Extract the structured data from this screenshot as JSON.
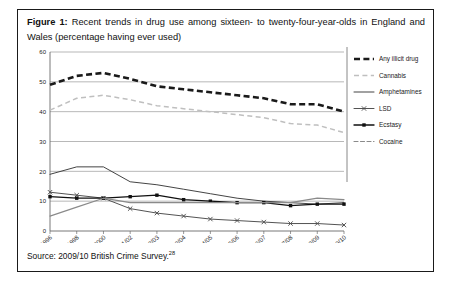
{
  "caption": {
    "figure_label": "Figure 1:",
    "text": " Recent trends in drug use among sixteen- to twenty-four-year-olds in England and Wales (percentage having ever used)"
  },
  "source": {
    "text": "Source: 2009/10 British Crime Survey.",
    "footnote_marker": "28"
  },
  "colors": {
    "any_illicit_drug": "#1a1a1a",
    "cannabis": "#bfbfbf",
    "amphetamines": "#3a3a3a",
    "lsd": "#4a4a4a",
    "ecstasy": "#111111",
    "cocaine": "#8a8a8a",
    "grid": "#9a9a9a",
    "axis": "#6a6a6a",
    "border": "#1a1a1a"
  },
  "chart_data": {
    "type": "line",
    "title": "Recent trends in drug use among sixteen- to twenty-four-year-olds in England and Wales (percentage having ever used)",
    "xlabel": "",
    "ylabel": "",
    "ylim": [
      0,
      60
    ],
    "yticks": [
      0,
      10,
      20,
      30,
      40,
      50,
      60
    ],
    "ytick_labels": [
      "0",
      "10",
      "20",
      "30",
      "40",
      "50",
      "60"
    ],
    "grid": true,
    "legend_position": "right",
    "categories": [
      "1996",
      "1998",
      "2000",
      "2001/02",
      "2002/03",
      "2003/04",
      "2004/05",
      "2005/06",
      "2006/07",
      "2007/08",
      "2008/09",
      "2009/10"
    ],
    "series": [
      {
        "name": "Any illicit drug",
        "style": "thick-dashed",
        "color": "#1a1a1a",
        "values": [
          49.0,
          52.0,
          53.0,
          51.0,
          48.5,
          47.5,
          46.5,
          45.5,
          44.5,
          42.5,
          42.5,
          40.0
        ]
      },
      {
        "name": "Cannabis",
        "style": "light-dashed",
        "color": "#bfbfbf",
        "values": [
          40.5,
          44.5,
          45.5,
          44.0,
          42.0,
          41.0,
          40.0,
          39.0,
          38.0,
          36.0,
          35.5,
          33.0
        ]
      },
      {
        "name": "Amphetamines",
        "style": "solid",
        "color": "#3a3a3a",
        "values": [
          19.0,
          21.5,
          21.5,
          16.5,
          15.5,
          14.0,
          12.5,
          11.0,
          10.0,
          9.5,
          9.0,
          9.5
        ]
      },
      {
        "name": "LSD",
        "style": "solid-cross",
        "color": "#4a4a4a",
        "values": [
          13.0,
          12.0,
          11.0,
          7.5,
          6.0,
          5.0,
          4.0,
          3.5,
          3.0,
          2.5,
          2.5,
          2.0
        ]
      },
      {
        "name": "Ecstasy",
        "style": "solid-square",
        "color": "#111111",
        "values": [
          11.5,
          11.0,
          11.0,
          11.5,
          12.0,
          10.5,
          10.0,
          9.5,
          9.5,
          8.5,
          9.0,
          9.0
        ]
      },
      {
        "name": "Cocaine",
        "style": "dash-dot",
        "color": "#8a8a8a",
        "values": [
          5.0,
          8.0,
          11.0,
          9.5,
          9.5,
          9.5,
          9.5,
          9.5,
          9.5,
          9.5,
          11.0,
          10.5
        ]
      }
    ]
  },
  "legend": {
    "items": [
      {
        "label": "Any illicit drug"
      },
      {
        "label": "Cannabis"
      },
      {
        "label": "Amphetamines"
      },
      {
        "label": "LSD"
      },
      {
        "label": "Ecstasy"
      },
      {
        "label": "Cocaine"
      }
    ]
  }
}
